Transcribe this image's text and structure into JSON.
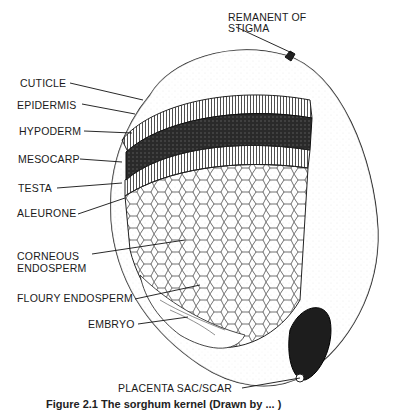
{
  "figure": {
    "labels": {
      "stigma": [
        "REMANENT OF",
        "STIGMA"
      ],
      "cuticle": "CUTICLE",
      "epidermis": "EPIDERMIS",
      "hypoderm": "HYPODERM",
      "mesocarp": "MESOCARP",
      "testa": "TESTA",
      "aleurone": "ALEURONE",
      "corneous": [
        "CORNEOUS",
        "ENDOSPERM"
      ],
      "floury": "FLOURY ENDOSPERM",
      "embryo": "EMBRYO",
      "placenta": "PLACENTA SAC/SCAR"
    },
    "caption": "Figure 2.1  The sorghum kernel (Drawn by ... )"
  }
}
